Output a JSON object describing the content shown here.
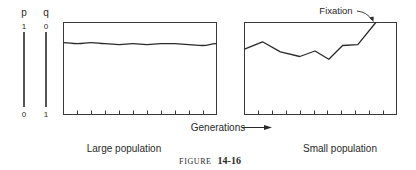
{
  "figure": {
    "caption_prefix": "FIGURE",
    "caption_number": "14-16"
  },
  "scale": {
    "p_label": "p",
    "q_label": "q",
    "p_top": "1",
    "p_bottom": "0",
    "q_top": "0",
    "q_bottom": "1"
  },
  "axis": {
    "x_label": "Generations"
  },
  "annotation": {
    "fixation": "Fixation"
  },
  "chart_data": [
    {
      "type": "line",
      "title": "Large population",
      "xlabel": "Generations",
      "ylabel": "p (allele frequency)",
      "ylim": [
        0,
        1
      ],
      "grid": false,
      "x_ticks": 10,
      "x": [
        0,
        1,
        2,
        3,
        4,
        5,
        6,
        7,
        8,
        9,
        10,
        11
      ],
      "values": [
        0.78,
        0.77,
        0.78,
        0.77,
        0.76,
        0.77,
        0.76,
        0.77,
        0.77,
        0.76,
        0.75,
        0.77
      ],
      "values_note": "approximate; traced at low precision, not per-vertex"
    },
    {
      "type": "line",
      "title": "Small population",
      "xlabel": "Generations",
      "ylabel": "p (allele frequency)",
      "ylim": [
        0,
        1
      ],
      "grid": false,
      "x_ticks": 10,
      "x": [
        0,
        1.3,
        2.6,
        4.0,
        5.1,
        6.1,
        7.1,
        8.2,
        9.5
      ],
      "values": [
        0.71,
        0.79,
        0.68,
        0.63,
        0.69,
        0.6,
        0.75,
        0.76,
        1.0
      ],
      "annotations": [
        {
          "text": "Fixation",
          "x": 9.5,
          "y": 1.0
        }
      ]
    }
  ]
}
